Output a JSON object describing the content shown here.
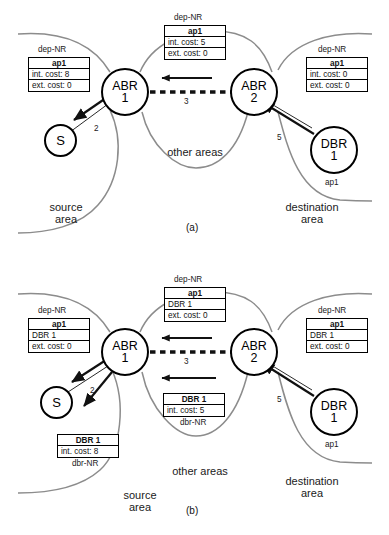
{
  "figure": {
    "panels": [
      {
        "tag": "(a)",
        "nodes": [
          {
            "name": "abr1",
            "line1": "ABR",
            "line2": "1"
          },
          {
            "name": "abr2",
            "line1": "ABR",
            "line2": "2"
          },
          {
            "name": "s",
            "line1": "S",
            "line2": ""
          },
          {
            "name": "dbr1",
            "line1": "DBR",
            "line2": "1"
          }
        ],
        "node_tags": [
          {
            "name": "dbr1-ap1",
            "text": "ap1"
          }
        ],
        "tables": [
          {
            "name": "left-table",
            "caption": "dep-NR",
            "rows": [
              "ap1",
              "int. cost: 8",
              "ext. cost: 0"
            ]
          },
          {
            "name": "center-table",
            "caption": "dep-NR",
            "rows": [
              "ap1",
              "int. cost: 5",
              "ext. cost: 0"
            ]
          },
          {
            "name": "right-table",
            "caption": "dep-NR",
            "rows": [
              "ap1",
              "int. cost: 0",
              "ext. cost: 0"
            ]
          }
        ],
        "edge_labels": [
          {
            "name": "edge-label-abr1-s",
            "text": "2"
          },
          {
            "name": "edge-label-abr1-abr2",
            "text": "3"
          },
          {
            "name": "edge-label-dbr1-abr2",
            "text": "5"
          }
        ],
        "area_labels": [
          {
            "name": "area-label-source",
            "line1": "source",
            "line2": "area"
          },
          {
            "name": "area-label-other",
            "line1": "other areas",
            "line2": ""
          },
          {
            "name": "area-label-destination",
            "line1": "destination",
            "line2": "area"
          }
        ]
      },
      {
        "tag": "(b)",
        "nodes": [
          {
            "name": "abr1",
            "line1": "ABR",
            "line2": "1"
          },
          {
            "name": "abr2",
            "line1": "ABR",
            "line2": "2"
          },
          {
            "name": "s",
            "line1": "S",
            "line2": ""
          },
          {
            "name": "dbr1",
            "line1": "DBR",
            "line2": "1"
          }
        ],
        "node_tags": [
          {
            "name": "dbr1-ap1",
            "text": "ap1"
          }
        ],
        "tables": [
          {
            "name": "left-table",
            "caption": "dep-NR",
            "rows": [
              "ap1",
              "DBR 1",
              "ext. cost: 0"
            ]
          },
          {
            "name": "center-top-table",
            "caption": "dep-NR",
            "rows": [
              "ap1",
              "DBR 1",
              "ext. cost: 0"
            ]
          },
          {
            "name": "right-table",
            "caption": "dep-NR",
            "rows": [
              "ap1",
              "DBR 1",
              "ext. cost: 0"
            ]
          },
          {
            "name": "center-lower-table",
            "caption": "dbr-NR",
            "rows": [
              "DBR 1",
              "int. cost: 5"
            ]
          },
          {
            "name": "bottom-left-table",
            "caption": "dbr-NR",
            "rows": [
              "DBR 1",
              "int. cost: 8"
            ]
          }
        ],
        "edge_labels": [
          {
            "name": "edge-label-abr1-s",
            "text": "2"
          },
          {
            "name": "edge-label-abr1-abr2",
            "text": "3"
          },
          {
            "name": "edge-label-dbr1-abr2",
            "text": "5"
          }
        ],
        "area_labels": [
          {
            "name": "area-label-source",
            "line1": "source",
            "line2": "area"
          },
          {
            "name": "area-label-other",
            "line1": "other areas",
            "line2": ""
          },
          {
            "name": "area-label-destination",
            "line1": "destination",
            "line2": "area"
          }
        ]
      }
    ],
    "colors": {
      "area_boundary": "#8c8c8c",
      "ink": "#000000",
      "background": "#ffffff"
    }
  }
}
